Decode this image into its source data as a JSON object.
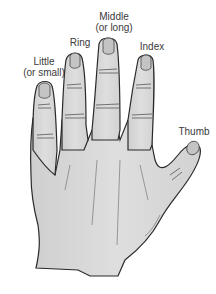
{
  "diagram": {
    "colors": {
      "skin": "#d9d9d9",
      "outline": "#2a2a2a",
      "nail": "#c4c4c4",
      "label": "#3a3a3a",
      "background": "#ffffff"
    },
    "labels": [
      {
        "id": "little",
        "line1": "Little",
        "line2": "(or small)"
      },
      {
        "id": "ring",
        "line1": "Ring",
        "line2": ""
      },
      {
        "id": "middle",
        "line1": "Middle",
        "line2": "(or long)"
      },
      {
        "id": "index",
        "line1": "Index",
        "line2": ""
      },
      {
        "id": "thumb",
        "line1": "Thumb",
        "line2": ""
      }
    ]
  }
}
